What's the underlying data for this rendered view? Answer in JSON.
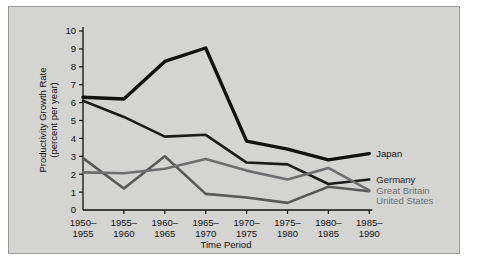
{
  "chart_data": {
    "type": "line",
    "title": "",
    "xlabel": "Time Period",
    "ylabel": "Productivity Growth Rate (percent per year)",
    "ylabel_line1": "Productivity Growth Rate",
    "ylabel_line2": "(percent per year)",
    "ylim": [
      0,
      10
    ],
    "yticks": [
      0,
      1,
      2,
      3,
      4,
      5,
      6,
      7,
      8,
      9,
      10
    ],
    "ytick_labels": [
      "0",
      "1",
      "2",
      "3",
      "4",
      "5",
      "6",
      "7",
      "8",
      "9",
      "10"
    ],
    "grid": false,
    "legend_position": "right-inline",
    "categories": [
      "1950-\n1955",
      "1955-\n1960",
      "1960-\n1965",
      "1965-\n1970",
      "1970-\n1975",
      "1975-\n1980",
      "1980-\n1985",
      "1985-\n1990"
    ],
    "category_rows": [
      {
        "top": "1950–",
        "bottom": "1955"
      },
      {
        "top": "1955–",
        "bottom": "1960"
      },
      {
        "top": "1960–",
        "bottom": "1965"
      },
      {
        "top": "1965–",
        "bottom": "1970"
      },
      {
        "top": "1970–",
        "bottom": "1975"
      },
      {
        "top": "1975–",
        "bottom": "1980"
      },
      {
        "top": "1980–",
        "bottom": "1985"
      },
      {
        "top": "1985–",
        "bottom": "1990"
      }
    ],
    "series": [
      {
        "name": "Japan",
        "color": "#111111",
        "width": 3.4,
        "values": [
          6.3,
          6.2,
          8.3,
          9.05,
          3.85,
          3.4,
          2.8,
          3.15
        ]
      },
      {
        "name": "Germany",
        "color": "#1c1c1c",
        "width": 2.6,
        "values": [
          6.1,
          5.2,
          4.1,
          4.2,
          2.65,
          2.55,
          1.45,
          1.7
        ]
      },
      {
        "name": "Great Britain",
        "color": "#59595a",
        "width": 2.6,
        "values": [
          2.9,
          1.2,
          3.0,
          0.9,
          0.7,
          0.4,
          1.3,
          1.05
        ]
      },
      {
        "name": "United States",
        "color": "#6e6e70",
        "width": 2.6,
        "values": [
          2.1,
          2.05,
          2.3,
          2.85,
          2.2,
          1.7,
          2.35,
          1.1
        ]
      }
    ],
    "legend_entries": [
      {
        "label": "Japan",
        "color": "#111111"
      },
      {
        "label": "Germany",
        "color": "#1c1c1c"
      },
      {
        "label": "Great Britain",
        "color": "#6e6e70"
      },
      {
        "label": "United States",
        "color": "#6e6e70"
      }
    ],
    "colors": {
      "background": "#d4d4d2",
      "page": "#ffffff",
      "axis": "#111111",
      "japan": "#111111",
      "germany": "#1c1c1c",
      "great_britain": "#59595a",
      "united_states": "#6e6e70"
    }
  }
}
